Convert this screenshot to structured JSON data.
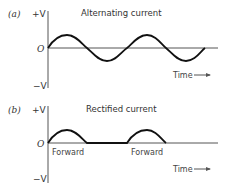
{
  "panels": [
    {
      "id": "a",
      "label": "(a)",
      "title": "Alternating current",
      "y_top_label": "+V",
      "y_zero_label": "O",
      "y_bottom_label": "−V",
      "x_label": "Time",
      "waveform": "sine"
    },
    {
      "id": "b",
      "label": "(b)",
      "title": "Rectified current",
      "y_top_label": "+V",
      "y_zero_label": "O",
      "y_bottom_label": "−V",
      "x_label": "Time",
      "waveform": "half-wave rectified",
      "segment_labels": [
        "Forward",
        "Forward"
      ]
    }
  ],
  "colors": {
    "curve": "#111111",
    "axis": "#555555",
    "text": "#333333"
  }
}
